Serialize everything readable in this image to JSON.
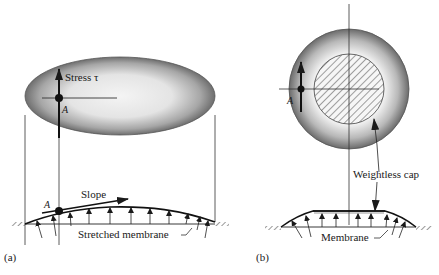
{
  "figure": {
    "panel_a": {
      "label": "(a)",
      "stress_label": "Stress τ",
      "point_label_top": "A",
      "point_label_bottom": "A",
      "slope_label": "Slope",
      "membrane_label": "Stretched membrane"
    },
    "panel_b": {
      "label": "(b)",
      "point_label": "A",
      "cap_label": "Weightless cap",
      "membrane_label": "Membrane"
    },
    "colors": {
      "line": "#1a1a1a",
      "shade_dark": "#6e6e6e",
      "shade_light": "#f2f2f2",
      "background": "#ffffff"
    }
  }
}
